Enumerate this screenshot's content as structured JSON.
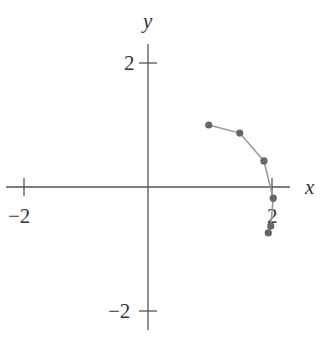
{
  "chart_data": {
    "type": "scatter",
    "title": "",
    "xlabel": "x",
    "ylabel": "y",
    "xlim": [
      -2.4,
      2.5
    ],
    "ylim": [
      -2.5,
      2.6
    ],
    "grid": false,
    "legend": null,
    "x_ticks": [
      {
        "value": -2,
        "label": "−2"
      },
      {
        "value": 2,
        "label": "2"
      }
    ],
    "y_ticks": [
      {
        "value": 2,
        "label": "2"
      },
      {
        "value": -2,
        "label": "−2"
      }
    ],
    "series": [
      {
        "name": "trajectory",
        "connected": true,
        "points": [
          {
            "x": 0.98,
            "y": 1.0
          },
          {
            "x": 1.48,
            "y": 0.87
          },
          {
            "x": 1.87,
            "y": 0.42
          },
          {
            "x": 2.02,
            "y": -0.18
          },
          {
            "x": 1.98,
            "y": -0.63
          },
          {
            "x": 1.94,
            "y": -0.74
          }
        ]
      }
    ],
    "colors": {
      "axis": "#555555",
      "line": "#9a9a9a",
      "marker": "#666666"
    }
  }
}
